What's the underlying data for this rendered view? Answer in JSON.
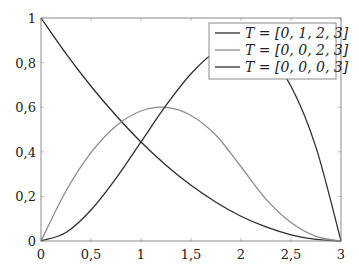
{
  "chart_data": {
    "type": "line",
    "title": "",
    "xlabel": "",
    "ylabel": "",
    "xlim": [
      0,
      3
    ],
    "ylim": [
      0,
      1
    ],
    "grid": false,
    "legend_position": "upper right",
    "x_ticks": [
      "0",
      "0,5",
      "1",
      "1,5",
      "2",
      "2,5",
      "3"
    ],
    "y_ticks": [
      "0",
      "0,2",
      "0,4",
      "0,6",
      "0,8",
      "1"
    ],
    "x": [
      0,
      0.25,
      0.5,
      0.75,
      1,
      1.25,
      1.5,
      1.75,
      2,
      2.25,
      2.5,
      2.75,
      3
    ],
    "series": [
      {
        "name": "T = [0, 1, 2, 3]",
        "color": "#2b2b2b",
        "values": [
          1.0,
          0.84,
          0.694,
          0.563,
          0.444,
          0.34,
          0.25,
          0.174,
          0.111,
          0.063,
          0.028,
          0.007,
          0.0
        ]
      },
      {
        "name": "T = [0, 0, 2, 3]",
        "color": "#8c8c8c",
        "values": [
          0.0,
          0.224,
          0.396,
          0.516,
          0.583,
          0.599,
          0.563,
          0.474,
          0.333,
          0.188,
          0.083,
          0.021,
          0.0
        ]
      },
      {
        "name": "T = [0, 0, 0, 3]",
        "color": "#2a2f3a",
        "values": [
          0.0,
          0.038,
          0.139,
          0.281,
          0.444,
          0.608,
          0.75,
          0.851,
          0.889,
          0.844,
          0.694,
          0.42,
          0.0
        ]
      }
    ]
  },
  "legend": {
    "entries": [
      "T = [0, 1, 2, 3]",
      "T = [0, 0, 2, 3]",
      "T = [0, 0, 0, 3]"
    ]
  }
}
